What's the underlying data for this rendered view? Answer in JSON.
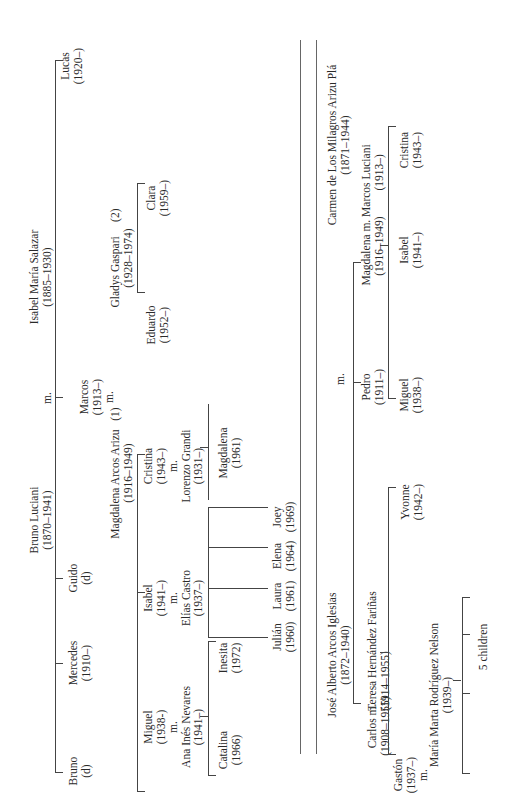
{
  "tree1": {
    "title": "Luciani family",
    "patriarch": {
      "name": "Bruno Luciani",
      "dates": "(1870–1941)"
    },
    "marriage_mark": "m.",
    "matriarch": {
      "name": "Isabel María Salazar",
      "dates": "(1885–1930)"
    },
    "children": [
      {
        "name": "Bruno",
        "dates": "(d)"
      },
      {
        "name": "Mercedes",
        "dates": "(1910–)"
      },
      {
        "name": "Guido",
        "dates": "(d)"
      },
      {
        "name": "Marcos",
        "dates": "(1913–)",
        "mark": "m."
      },
      {
        "name": "Lucas",
        "dates": "(1920–)"
      }
    ],
    "spouse1": {
      "name": "Magdalena Arcos Arizu",
      "dates": "(1916–1949)",
      "note": "(1)"
    },
    "spouse2": {
      "name": "Gladys Gaspari",
      "dates": "(1928–1974)",
      "note": "(2)"
    },
    "grandchildren1": [
      {
        "name": "Miguel",
        "dates": "(1938-)",
        "mark": "m.",
        "spouse": "Ana Inés Nevares",
        "spouse_dates": "(1941–)"
      },
      {
        "name": "Isabel",
        "dates": "(1941–)",
        "mark": "m.",
        "spouse": "Elías Castro",
        "spouse_dates": "(1937–)"
      },
      {
        "name": "Cristina",
        "dates": "(1943–)",
        "mark": "m.",
        "spouse": "Lorenzo Grandi",
        "spouse_dates": "(1931–)"
      }
    ],
    "grandchildren2": [
      {
        "name": "Eduardo",
        "dates": "(1952–)"
      },
      {
        "name": "Clara",
        "dates": "(1959–)"
      }
    ],
    "great_grandchildren_miguel": [
      {
        "name": "Catalina",
        "dates": "(1966)"
      },
      {
        "name": "Inesita",
        "dates": "(1972)"
      }
    ],
    "great_grandchildren_isabel": [
      {
        "name": "Julián",
        "dates": "(1960)"
      },
      {
        "name": "Laura",
        "dates": "(1961)"
      },
      {
        "name": "Elena",
        "dates": "(1964)"
      },
      {
        "name": "Joey",
        "dates": "(1969)"
      }
    ],
    "great_grandchildren_cristina": [
      {
        "name": "Magdalena",
        "dates": "(1961)"
      }
    ]
  },
  "tree2": {
    "title": "Arcos family",
    "patriarch": {
      "name": "José Alberto Arcos Iglesias",
      "dates": "(1872–1940)"
    },
    "marriage_mark": "m.",
    "matriarch": {
      "name": "Carmen de Los Milagros Arizu Plá",
      "dates": "(1871–1944)"
    },
    "children": [
      {
        "name": "Carlos",
        "mark": "m.",
        "dates": "(1908–1955)",
        "spouse": "Teresa Hernández Fariñas",
        "spouse_dates": "(1914–1955)"
      },
      {
        "name": "Pedro",
        "dates": "(1911–)"
      },
      {
        "name": "Magdalena",
        "dates": "(1916–1949)",
        "mark": "m.",
        "spouse": "Marcos Luciani",
        "spouse_dates": "(1913–)"
      }
    ],
    "carlos_children": [
      {
        "name": "Gastón",
        "dates": "(1937–)",
        "mark": "m.",
        "spouse": "María Marta Rodríguez Nelson",
        "spouse_dates": "(1939–)"
      },
      {
        "name": "Yvonne",
        "dates": "(1942–)"
      }
    ],
    "gaston_children_label": "5 children",
    "magdalena_children": [
      {
        "name": "Miguel",
        "dates": "(1938–)"
      },
      {
        "name": "Isabel",
        "dates": "(1941–)"
      },
      {
        "name": "Cristina",
        "dates": "(1943–)"
      }
    ]
  }
}
